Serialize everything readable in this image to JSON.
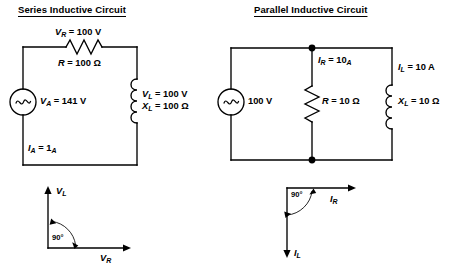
{
  "page": {
    "background": "#ffffff",
    "ink": "#000000",
    "width": 456,
    "height": 272
  },
  "series_circuit": {
    "title": "Series Inductive Circuit",
    "source": {
      "symbol": "ac-source",
      "label_var": "V",
      "label_sub": "A",
      "label_value": "= 141 V",
      "label_full": "VA = 141 V"
    },
    "resistor": {
      "symbol": "resistor-zigzag",
      "voltage_var": "V",
      "voltage_sub": "R",
      "voltage_value": "= 100 V",
      "resistance_var": "R",
      "resistance_value": "= 100 Ω"
    },
    "inductor": {
      "symbol": "inductor-coil",
      "voltage_var": "V",
      "voltage_sub": "L",
      "voltage_value": "= 100 V",
      "reactance_var": "X",
      "reactance_sub": "L",
      "reactance_value": "= 100 Ω"
    },
    "current": {
      "var": "I",
      "sub": "A",
      "value": "= 1",
      "value_sub": "A"
    }
  },
  "parallel_circuit": {
    "title": "Parallel Inductive Circuit",
    "source": {
      "symbol": "ac-source",
      "label_value": "100 V"
    },
    "branch_current": {
      "var": "I",
      "sub": "R",
      "value": "= 10",
      "value_sub": "A"
    },
    "resistor": {
      "symbol": "resistor-zigzag",
      "resistance_var": "R",
      "resistance_value": "= 10 Ω"
    },
    "inductor": {
      "symbol": "inductor-coil",
      "current_var": "I",
      "current_sub": "L",
      "current_value": "= 10 A",
      "reactance_var": "X",
      "reactance_sub": "L",
      "reactance_value": "= 10 Ω"
    }
  },
  "series_phasor": {
    "vertical_var": "V",
    "vertical_sub": "L",
    "horizontal_var": "V",
    "horizontal_sub": "R",
    "angle_label": "90°"
  },
  "parallel_phasor": {
    "horizontal_var": "I",
    "horizontal_sub": "R",
    "vertical_var": "I",
    "vertical_sub": "L",
    "angle_label": "90°"
  }
}
